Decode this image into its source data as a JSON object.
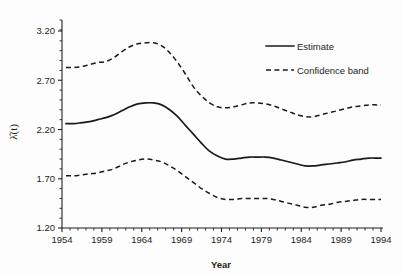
{
  "chart_data": {
    "type": "line",
    "title": "",
    "subtitle": "",
    "xlabel": "Year",
    "ylabel": "λ̂(t)",
    "xlim": [
      1954,
      1994
    ],
    "ylim": [
      1.2,
      3.2
    ],
    "grid": false,
    "legend_position": "top-right",
    "xticks": [
      1954,
      1959,
      1964,
      1969,
      1974,
      1979,
      1984,
      1989,
      1994
    ],
    "xtick_labels": [
      "1954",
      "1959",
      "1964",
      "1969",
      "1974",
      "1979",
      "1984",
      "1989",
      "1994"
    ],
    "yticks": [
      1.2,
      1.7,
      2.2,
      2.7,
      3.2
    ],
    "ytick_labels": [
      "1.20",
      "1.70",
      "2.20",
      "2.70",
      "3.20"
    ],
    "x": [
      1954.5,
      1955.5,
      1956.5,
      1957.5,
      1958.5,
      1959.5,
      1960.5,
      1961.5,
      1962.5,
      1963.5,
      1964.5,
      1965.5,
      1966.5,
      1967.5,
      1968.5,
      1969.5,
      1970.5,
      1971.5,
      1972.5,
      1973.5,
      1974.5,
      1975.5,
      1976.5,
      1977.5,
      1978.5,
      1979.5,
      1980.5,
      1981.5,
      1982.5,
      1983.5,
      1984.5,
      1985.5,
      1986.5,
      1987.5,
      1988.5,
      1989.5,
      1990.5,
      1991.5,
      1992.5,
      1993.5,
      1994.0
    ],
    "series": [
      {
        "name": "Estimate",
        "style": "solid",
        "color": "#1a1a1a",
        "values": [
          2.26,
          2.26,
          2.27,
          2.28,
          2.3,
          2.32,
          2.35,
          2.39,
          2.43,
          2.46,
          2.47,
          2.47,
          2.45,
          2.4,
          2.33,
          2.24,
          2.15,
          2.06,
          1.98,
          1.93,
          1.9,
          1.9,
          1.91,
          1.92,
          1.92,
          1.92,
          1.91,
          1.89,
          1.87,
          1.85,
          1.83,
          1.83,
          1.84,
          1.85,
          1.86,
          1.87,
          1.89,
          1.9,
          1.91,
          1.91,
          1.91
        ]
      },
      {
        "name": "Confidence band upper",
        "style": "dashed",
        "color": "#1a1a1a",
        "values": [
          2.83,
          2.83,
          2.84,
          2.86,
          2.88,
          2.89,
          2.93,
          2.99,
          3.04,
          3.07,
          3.08,
          3.08,
          3.05,
          2.98,
          2.88,
          2.76,
          2.63,
          2.54,
          2.47,
          2.43,
          2.42,
          2.43,
          2.45,
          2.47,
          2.47,
          2.46,
          2.44,
          2.41,
          2.38,
          2.35,
          2.33,
          2.33,
          2.35,
          2.37,
          2.39,
          2.41,
          2.43,
          2.44,
          2.45,
          2.45,
          2.45
        ]
      },
      {
        "name": "Confidence band lower",
        "style": "dashed",
        "color": "#1a1a1a",
        "values": [
          1.73,
          1.73,
          1.74,
          1.75,
          1.76,
          1.78,
          1.8,
          1.84,
          1.87,
          1.89,
          1.9,
          1.89,
          1.87,
          1.83,
          1.78,
          1.72,
          1.66,
          1.6,
          1.55,
          1.51,
          1.49,
          1.49,
          1.5,
          1.5,
          1.5,
          1.5,
          1.49,
          1.47,
          1.45,
          1.43,
          1.41,
          1.41,
          1.43,
          1.44,
          1.46,
          1.47,
          1.48,
          1.49,
          1.49,
          1.49,
          1.49
        ]
      }
    ],
    "legend": [
      {
        "label": "Estimate",
        "style": "solid"
      },
      {
        "label": "Confidence band",
        "style": "dashed"
      }
    ]
  },
  "axes": {
    "x_title": "Year",
    "y_title": "λ̂(t)"
  }
}
